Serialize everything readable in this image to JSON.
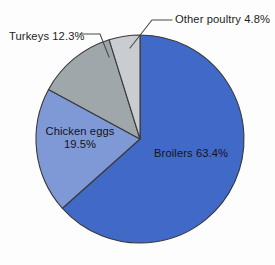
{
  "chart_data": {
    "type": "pie",
    "title": "",
    "subtitle": "",
    "xlabel": "",
    "ylabel": "",
    "grid": false,
    "legend_position": "none",
    "labels_inline": true,
    "categories": [
      "Broilers",
      "Chicken eggs",
      "Turkeys",
      "Other poultry"
    ],
    "values": [
      63.4,
      19.5,
      12.3,
      4.8
    ],
    "value_unit": "%",
    "slices": [
      {
        "name": "Broilers",
        "value": 63.4,
        "label": "Broilers 63.4%",
        "color": "#4169c8",
        "start_angle_deg": 0.0,
        "end_angle_deg": 228.24,
        "label_placement": "inside"
      },
      {
        "name": "Chicken eggs",
        "value": 19.5,
        "label": "Chicken eggs",
        "label_line2": "19.5%",
        "color": "#7e99d6",
        "start_angle_deg": 228.24,
        "end_angle_deg": 298.44,
        "label_placement": "inside"
      },
      {
        "name": "Turkeys",
        "value": 12.3,
        "label": "Turkeys 12.3%",
        "color": "#9fa7aa",
        "start_angle_deg": 298.44,
        "end_angle_deg": 342.72,
        "label_placement": "outside-leader"
      },
      {
        "name": "Other poultry",
        "value": 4.8,
        "label": "Other poultry 4.8%",
        "color": "#c9ccd0",
        "start_angle_deg": 342.72,
        "end_angle_deg": 360.0,
        "label_placement": "outside-leader"
      }
    ],
    "geometry": {
      "center_x": 140,
      "center_y": 139,
      "radius": 104,
      "start_at_twelve_oclock": true,
      "direction": "clockwise"
    },
    "colors": {
      "background": "#fdfdfd",
      "slice_outline": "#3a3a3a",
      "leader_line": "#4a4a4a",
      "label_text": "#1d1d22",
      "broilers": "#4169c8",
      "chicken_eggs": "#7e99d6",
      "turkeys": "#9fa7aa",
      "other_poultry": "#c9ccd0"
    }
  }
}
